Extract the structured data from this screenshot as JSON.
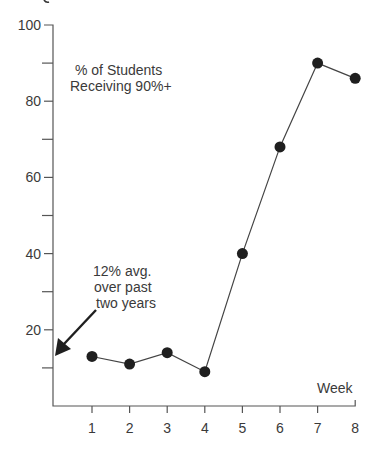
{
  "chart_data": {
    "type": "line",
    "title": "% of Students Receiving 90%+",
    "title_lines": [
      "% of Students",
      "Receiving 90%+"
    ],
    "xlabel": "Week",
    "ylabel": "",
    "x": [
      1,
      2,
      3,
      4,
      5,
      6,
      7,
      8
    ],
    "categories": [
      "1",
      "2",
      "3",
      "4",
      "5",
      "6",
      "7",
      "8"
    ],
    "series": [
      {
        "name": "% of Students Receiving 90%+",
        "values": [
          13,
          11,
          14,
          9,
          40,
          68,
          90,
          86
        ]
      }
    ],
    "ylim": [
      0,
      100
    ],
    "xlim": [
      0,
      8
    ],
    "y_major_ticks": [
      20,
      40,
      60,
      80,
      100
    ],
    "y_tick_labels": [
      "20",
      "40",
      "60",
      "80",
      "100"
    ],
    "y_minor_ticks": [
      10,
      30,
      50,
      70,
      90
    ],
    "x_tick_labels": [
      "1",
      "2",
      "3",
      "4",
      "5",
      "6",
      "7",
      "8"
    ],
    "grid": false,
    "legend": "none",
    "annotations": [
      {
        "text_lines": [
          "12% avg.",
          "over past",
          "two years"
        ],
        "arrow_to_value": 12,
        "arrow_target": "y-axis"
      }
    ],
    "colors": {
      "line": "#444444",
      "marker": "#1f1f1f",
      "axis": "#555555",
      "text": "#3a3a3a"
    }
  }
}
